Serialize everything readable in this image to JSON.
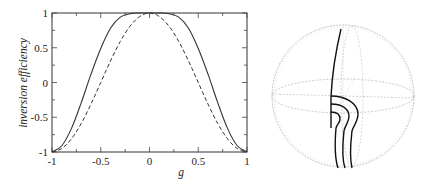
{
  "chart_data": [
    {
      "type": "line",
      "title": "",
      "xlabel": "g",
      "ylabel": "inversion efficiency",
      "xlim": [
        -1,
        1
      ],
      "ylim": [
        -1,
        1
      ],
      "grid": false,
      "legend": null,
      "x_ticks": [
        "-1",
        "-0.5",
        "0",
        "0.5",
        "1"
      ],
      "y_ticks": [
        "-1",
        "-0.5",
        "0",
        "0.5",
        "1"
      ],
      "x": [
        -1.0,
        -0.9,
        -0.8,
        -0.7,
        -0.6,
        -0.5,
        -0.4,
        -0.3,
        -0.2,
        -0.1,
        0.0,
        0.1,
        0.2,
        0.3,
        0.4,
        0.5,
        0.6,
        0.7,
        0.8,
        0.9,
        1.0
      ],
      "series": [
        {
          "name": "solid",
          "style": "solid",
          "values": [
            -1.0,
            -0.91,
            -0.66,
            -0.29,
            0.12,
            0.49,
            0.78,
            0.94,
            0.99,
            1.0,
            1.0,
            1.0,
            0.99,
            0.94,
            0.78,
            0.49,
            0.12,
            -0.29,
            -0.66,
            -0.91,
            -1.0
          ]
        },
        {
          "name": "dashed",
          "style": "dashed",
          "values": [
            -1.0,
            -0.95,
            -0.81,
            -0.59,
            -0.31,
            0.0,
            0.31,
            0.59,
            0.81,
            0.95,
            1.0,
            0.95,
            0.81,
            0.59,
            0.31,
            0.0,
            -0.31,
            -0.59,
            -0.81,
            -0.95,
            -1.0
          ]
        }
      ]
    },
    {
      "type": "diagram",
      "title": "",
      "description": "Bloch sphere with three nested trajectories",
      "trajectories": 3
    }
  ],
  "plot": {
    "ylabel": "inversion efficiency",
    "xlabel": "g",
    "x_tick_labels": [
      "-1",
      "-0.5",
      "0",
      "0.5",
      "1"
    ],
    "y_tick_labels": [
      "1",
      "0.5",
      "0",
      "-0.5",
      "-1"
    ]
  }
}
